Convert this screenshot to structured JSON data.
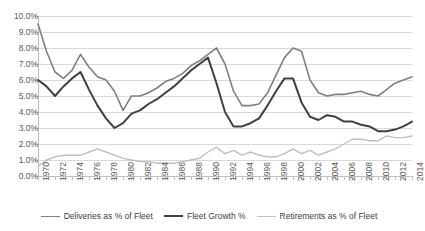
{
  "chart_data": {
    "type": "line",
    "title": "",
    "xlabel": "",
    "ylabel": "",
    "ylim": [
      0,
      0.1
    ],
    "ytick_labels": [
      "10.0%",
      "9.0%",
      "8.0%",
      "7.0%",
      "6.0%",
      "5.0%",
      "4.0%",
      "3.0%",
      "2.0%",
      "1.0%",
      "0.0%"
    ],
    "ytick_values": [
      10.0,
      9.0,
      8.0,
      7.0,
      6.0,
      5.0,
      4.0,
      3.0,
      2.0,
      1.0,
      0.0
    ],
    "grid": true,
    "legend_position": "bottom",
    "x": [
      1970,
      1971,
      1972,
      1973,
      1974,
      1975,
      1976,
      1977,
      1978,
      1979,
      1980,
      1981,
      1982,
      1983,
      1984,
      1985,
      1986,
      1987,
      1988,
      1989,
      1990,
      1991,
      1992,
      1993,
      1994,
      1995,
      1996,
      1997,
      1998,
      1999,
      2000,
      2001,
      2002,
      2003,
      2004,
      2005,
      2006,
      2007,
      2008,
      2009,
      2010,
      2011,
      2012,
      2013,
      2014
    ],
    "xtick_labels": [
      "1970",
      "1972",
      "1974",
      "1976",
      "1978",
      "1980",
      "1982",
      "1984",
      "1986",
      "1988",
      "1990",
      "1992",
      "1994",
      "1996",
      "1998",
      "2000",
      "2002",
      "2004",
      "2006",
      "2008",
      "2010",
      "2012",
      "2014"
    ],
    "series": [
      {
        "name": "Deliveries as % of Fleet",
        "color": "#808080",
        "width": 1.6,
        "values": [
          9.5,
          7.8,
          6.5,
          6.1,
          6.6,
          7.6,
          6.8,
          6.2,
          6.0,
          5.3,
          4.1,
          5.0,
          5.0,
          5.2,
          5.5,
          5.9,
          6.1,
          6.4,
          6.9,
          7.2,
          7.6,
          8.0,
          7.0,
          5.3,
          4.4,
          4.4,
          4.5,
          5.2,
          6.3,
          7.4,
          8.0,
          7.8,
          6.0,
          5.2,
          5.0,
          5.1,
          5.1,
          5.2,
          5.3,
          5.1,
          5.0,
          5.4,
          5.8,
          6.0,
          6.2
        ]
      },
      {
        "name": "Fleet Growth %",
        "color": "#404040",
        "width": 2.0,
        "values": [
          6.0,
          5.6,
          5.0,
          5.6,
          6.1,
          6.5,
          5.4,
          4.4,
          3.6,
          3.0,
          3.3,
          3.9,
          4.1,
          4.5,
          4.8,
          5.2,
          5.6,
          6.1,
          6.6,
          7.0,
          7.4,
          5.8,
          4.0,
          3.1,
          3.1,
          3.3,
          3.6,
          4.4,
          5.3,
          6.1,
          6.1,
          4.6,
          3.7,
          3.5,
          3.8,
          3.7,
          3.4,
          3.4,
          3.2,
          3.1,
          2.8,
          2.8,
          2.9,
          3.1,
          3.4
        ]
      },
      {
        "name": "Retirements as % of Fleet",
        "color": "#bfbfbf",
        "width": 1.4,
        "values": [
          0.6,
          1.0,
          1.2,
          1.3,
          1.3,
          1.3,
          1.5,
          1.7,
          1.5,
          1.3,
          1.1,
          1.0,
          0.9,
          0.9,
          0.8,
          0.8,
          0.8,
          0.9,
          1.0,
          1.1,
          1.5,
          1.8,
          1.4,
          1.6,
          1.3,
          1.5,
          1.3,
          1.2,
          1.2,
          1.4,
          1.7,
          1.4,
          1.6,
          1.3,
          1.5,
          1.7,
          2.0,
          2.3,
          2.3,
          2.2,
          2.2,
          2.5,
          2.4,
          2.4,
          2.5
        ]
      }
    ]
  },
  "legend": {
    "items": [
      {
        "label": "Deliveries as % of Fleet"
      },
      {
        "label": "Fleet Growth %"
      },
      {
        "label": "Retirements as % of Fleet"
      }
    ]
  }
}
